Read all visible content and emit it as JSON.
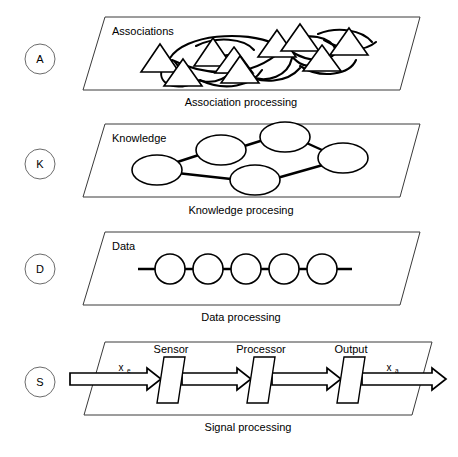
{
  "figure": {
    "title": "",
    "background_color": "#ffffff",
    "line_color": "#000000",
    "frame_color": "#3a3a3a"
  },
  "layers": [
    {
      "key": "A",
      "marker_label": "A",
      "inner_label": "Associations",
      "caption": "Association processing",
      "node_shape": "triangle",
      "node_count": 9,
      "link_style": "curved-arcs"
    },
    {
      "key": "K",
      "marker_label": "K",
      "inner_label": "Knowledge",
      "caption": "Knowledge procesing",
      "node_shape": "ellipse",
      "node_count": 5,
      "link_style": "straight-edges"
    },
    {
      "key": "D",
      "marker_label": "D",
      "inner_label": "Data",
      "caption": "Data processing",
      "node_shape": "circle",
      "node_count": 5,
      "link_style": "horizontal-chain"
    },
    {
      "key": "S",
      "marker_label": "S",
      "inner_label": "",
      "caption": "Signal processing",
      "node_shape": "rectangle",
      "node_count": 3,
      "link_style": "block-arrows",
      "blocks": [
        "Sensor",
        "Processor",
        "Output"
      ],
      "input_signal": "x",
      "input_signal_subscript": "e",
      "output_signal": "x",
      "output_signal_subscript": "a"
    }
  ]
}
